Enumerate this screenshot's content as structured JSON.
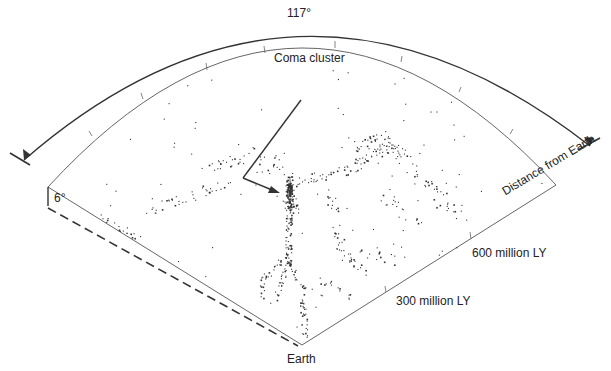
{
  "diagram": {
    "opening_angle_label": "117°",
    "thickness_label": "6°",
    "callout": {
      "label": "Coma cluster",
      "target": "dense galaxy clump near center of wedge"
    },
    "origin_label": "Earth",
    "radial_axis": {
      "title": "Distance from Earth",
      "ticks": [
        {
          "label": "300 million LY"
        },
        {
          "label": "600 million LY"
        }
      ]
    },
    "colors": {
      "ink": "#222222",
      "dots": "#333333",
      "background": "#ffffff"
    }
  }
}
